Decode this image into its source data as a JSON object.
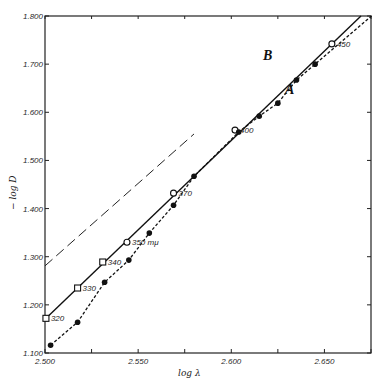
{
  "chart_data": {
    "type": "line",
    "title": "",
    "xlabel": "log λ",
    "ylabel": "− log D",
    "xlim": [
      2.5,
      2.675
    ],
    "ylim": [
      1.1,
      1.8
    ],
    "x_ticks": [
      "2.500",
      "2.550",
      "2.600",
      "2.650"
    ],
    "y_ticks": [
      "1.100",
      "1.200",
      "1.300",
      "1.400",
      "1.500",
      "1.600",
      "1.700",
      "1.800"
    ],
    "grid": false,
    "legend": "inline labels A and B",
    "series": [
      {
        "name": "A",
        "style": "solid line, open markers",
        "points": [
          {
            "x": 2.5005,
            "y": 1.172,
            "label": "320"
          },
          {
            "x": 2.5175,
            "y": 1.235,
            "label": "330"
          },
          {
            "x": 2.531,
            "y": 1.289,
            "label": "340"
          },
          {
            "x": 2.544,
            "y": 1.33,
            "label": "350 mμ"
          },
          {
            "x": 2.569,
            "y": 1.432,
            "label": "370"
          },
          {
            "x": 2.602,
            "y": 1.563,
            "label": "400"
          },
          {
            "x": 2.654,
            "y": 1.742,
            "label": "450"
          }
        ]
      },
      {
        "name": "B",
        "style": "dashed line, filled markers",
        "points": [
          {
            "x": 2.503,
            "y": 1.116
          },
          {
            "x": 2.5175,
            "y": 1.164
          },
          {
            "x": 2.532,
            "y": 1.247
          },
          {
            "x": 2.545,
            "y": 1.293
          },
          {
            "x": 2.556,
            "y": 1.349
          },
          {
            "x": 2.569,
            "y": 1.407
          },
          {
            "x": 2.58,
            "y": 1.467
          },
          {
            "x": 2.604,
            "y": 1.559
          },
          {
            "x": 2.615,
            "y": 1.592
          },
          {
            "x": 2.625,
            "y": 1.619
          },
          {
            "x": 2.635,
            "y": 1.667
          },
          {
            "x": 2.645,
            "y": 1.7
          }
        ]
      },
      {
        "name": "asymptote",
        "style": "long-dash line",
        "points": [
          {
            "x": 2.5,
            "y": 1.281
          },
          {
            "x": 2.58,
            "y": 1.555
          }
        ]
      }
    ],
    "annotations": [
      "A",
      "B",
      "350 mμ"
    ]
  }
}
